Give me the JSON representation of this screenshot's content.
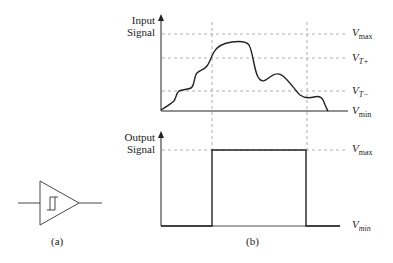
{
  "figure": {
    "panel_a": {
      "caption": "(a)",
      "symbol": "schmitt-trigger-buffer"
    },
    "panel_b": {
      "caption": "(b)",
      "input_plot": {
        "y_label_line1": "Input",
        "y_label_line2": "Signal",
        "levels": [
          {
            "name": "V",
            "sub": "max"
          },
          {
            "name": "V",
            "sub": "T+"
          },
          {
            "name": "V",
            "sub": "T−"
          },
          {
            "name": "V",
            "sub": "min"
          }
        ]
      },
      "output_plot": {
        "y_label_line1": "Output",
        "y_label_line2": "Signal",
        "levels": [
          {
            "name": "V",
            "sub": "max"
          },
          {
            "name": "V",
            "sub": "min"
          }
        ]
      }
    }
  }
}
